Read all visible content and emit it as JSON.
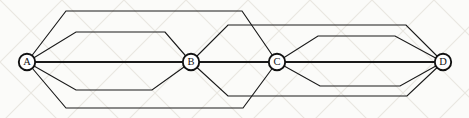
{
  "figure": {
    "kind": "undirected-multigraph-diagram",
    "width": 469,
    "height": 118,
    "background_color": "#fbfbf9",
    "stroke_color": "#1a1a1a",
    "node_fill_color": "#ffffff"
  },
  "nodes": [
    {
      "id": "A",
      "label": "A",
      "x": 27,
      "y": 62,
      "r": 8.2,
      "degree": 5
    },
    {
      "id": "B",
      "label": "B",
      "x": 191,
      "y": 62,
      "r": 8.2,
      "degree": 7
    },
    {
      "id": "C",
      "label": "C",
      "x": 277,
      "y": 62,
      "r": 8.2,
      "degree": 7
    },
    {
      "id": "D",
      "label": "D",
      "x": 443,
      "y": 62,
      "r": 8.2,
      "degree": 5
    }
  ],
  "edges": [
    {
      "id": "e1",
      "from": "A",
      "to": "C",
      "style": "arc-top",
      "points": "27,62 66,11 242,11 277,62"
    },
    {
      "id": "e2",
      "from": "A",
      "to": "B",
      "style": "arc-top",
      "points": "27,62 76,32 165,32 191,62"
    },
    {
      "id": "e3",
      "from": "A",
      "to": "B",
      "style": "spine",
      "points": "27,62 191,62"
    },
    {
      "id": "e4",
      "from": "A",
      "to": "B",
      "style": "arc-bottom",
      "points": "27,62 76,90 152,90 191,62"
    },
    {
      "id": "e5",
      "from": "A",
      "to": "C",
      "style": "arc-bottom",
      "points": "27,62 66,108 243,108 277,62"
    },
    {
      "id": "e6",
      "from": "B",
      "to": "D",
      "style": "arc-top",
      "points": "191,62 228,25 406,25 443,62"
    },
    {
      "id": "e7",
      "from": "B",
      "to": "C",
      "style": "spine",
      "points": "191,62 277,62"
    },
    {
      "id": "e8",
      "from": "B",
      "to": "D",
      "style": "arc-bottom",
      "points": "191,62 228,96 407,96 443,62"
    },
    {
      "id": "e9",
      "from": "C",
      "to": "D",
      "style": "arc-top",
      "points": "277,62 318,36 395,36 443,62"
    },
    {
      "id": "e10",
      "from": "C",
      "to": "D",
      "style": "spine",
      "points": "277,62 443,62"
    },
    {
      "id": "e11",
      "from": "C",
      "to": "D",
      "style": "arc-bottom",
      "points": "277,62 320,86 400,86 443,62"
    }
  ],
  "edge_counts": {
    "A_B": 3,
    "A_C": 2,
    "B_C": 1,
    "B_D": 2,
    "C_D": 3
  }
}
